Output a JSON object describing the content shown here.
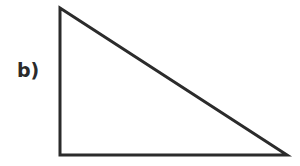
{
  "label": "b)",
  "triangle": {
    "stroke": "#2b2b2b",
    "stroke_width": 3,
    "points": "60,8 60,155 287,155"
  }
}
